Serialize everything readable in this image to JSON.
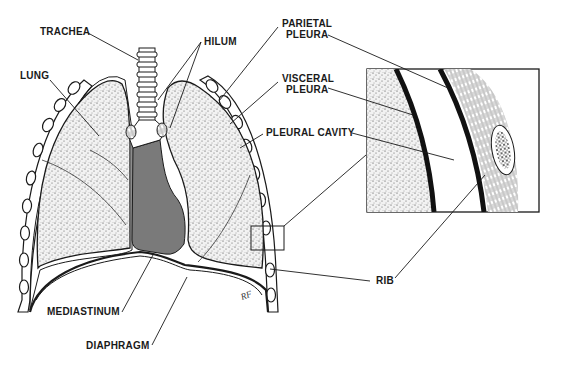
{
  "diagram": {
    "colors": {
      "ink": "#1a1a1a",
      "mediastinum": "#7a7a7a",
      "lung_fill": "#eeeeee",
      "background": "#ffffff"
    },
    "labels": {
      "trachea": "TRACHEA",
      "hilum": "HILUM",
      "lung": "LUNG",
      "parietal_1": "PARIETAL",
      "parietal_2": "PLEURA",
      "visceral_1": "VISCERAL",
      "visceral_2": "PLEURA",
      "pleural_cavity": "PLEURAL CAVITY",
      "rib": "RIB",
      "mediastinum": "MEDIASTINUM",
      "diaphragm": "DIAPHRAGM"
    },
    "signature": "RF"
  }
}
